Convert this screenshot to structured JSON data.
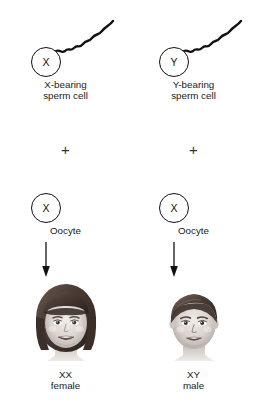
{
  "figure": {
    "background_color": "#ffffff",
    "line_color": "#111111",
    "text_color": "#1a1a1a"
  },
  "columns": [
    {
      "id": "x-bearing",
      "sperm": {
        "chromosome_label": "X",
        "caption": "X-bearing\nsperm cell"
      },
      "operator": "+",
      "oocyte": {
        "chromosome_label": "X",
        "caption": "Oocyte"
      },
      "offspring": {
        "face": "girl-face",
        "caption": "XX\nfemale"
      }
    },
    {
      "id": "y-bearing",
      "sperm": {
        "chromosome_label": "Y",
        "caption": "Y-bearing\nsperm cell"
      },
      "operator": "+",
      "oocyte": {
        "chromosome_label": "X",
        "caption": "Oocyte"
      },
      "offspring": {
        "face": "boy-face",
        "caption": "XY\nmale"
      }
    }
  ],
  "footer": {
    "note": ""
  }
}
